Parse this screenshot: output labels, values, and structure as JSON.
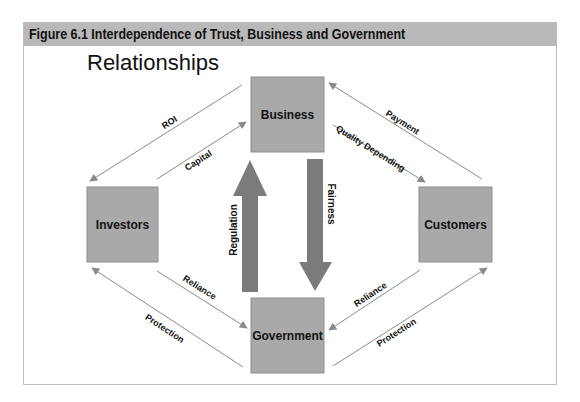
{
  "figure": {
    "title": "Figure 6.1 Interdependence of Trust, Business and Government",
    "subtitle": "Relationships"
  },
  "colors": {
    "header_bg": "#b9b9b9",
    "node_fill": "#a9a9a9",
    "node_stroke": "#8e8e8e",
    "big_arrow": "#7b7b7b",
    "thin_arrow": "#8a8a8a"
  },
  "nodes": {
    "business": "Business",
    "investors": "Investors",
    "customers": "Customers",
    "government": "Government"
  },
  "edges": {
    "roi": "ROI",
    "capital": "Capital",
    "payment": "Payment",
    "quality_depending": "Quality Depending",
    "reliance_left": "Reliance",
    "protection_left": "Protection",
    "reliance_right": "Reliance",
    "protection_right": "Protection",
    "regulation": "Regulation",
    "fairness": "Fairness"
  }
}
